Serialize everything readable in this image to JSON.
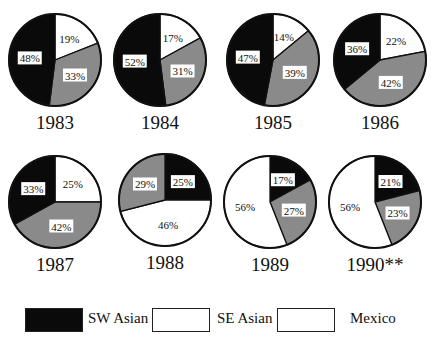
{
  "chart_data": [
    {
      "type": "pie",
      "title": "1983",
      "slices": [
        {
          "name": "SE Asian",
          "value": 19,
          "label": "19%"
        },
        {
          "name": "Mexico",
          "value": 33,
          "label": "33%"
        },
        {
          "name": "SW Asian",
          "value": 48,
          "label": "48%"
        }
      ]
    },
    {
      "type": "pie",
      "title": "1984",
      "slices": [
        {
          "name": "SE Asian",
          "value": 17,
          "label": "17%"
        },
        {
          "name": "Mexico",
          "value": 31,
          "label": "31%"
        },
        {
          "name": "SW Asian",
          "value": 52,
          "label": "52%"
        }
      ]
    },
    {
      "type": "pie",
      "title": "1985",
      "slices": [
        {
          "name": "SE Asian",
          "value": 14,
          "label": "14%"
        },
        {
          "name": "Mexico",
          "value": 39,
          "label": "39%"
        },
        {
          "name": "SW Asian",
          "value": 47,
          "label": "47%"
        }
      ]
    },
    {
      "type": "pie",
      "title": "1986",
      "slices": [
        {
          "name": "SE Asian",
          "value": 22,
          "label": "22%"
        },
        {
          "name": "Mexico",
          "value": 42,
          "label": "42%"
        },
        {
          "name": "SW Asian",
          "value": 36,
          "label": "36%"
        }
      ]
    },
    {
      "type": "pie",
      "title": "1987",
      "slices": [
        {
          "name": "SE Asian",
          "value": 25,
          "label": "25%"
        },
        {
          "name": "Mexico",
          "value": 42,
          "label": "42%"
        },
        {
          "name": "SW Asian",
          "value": 33,
          "label": "33%"
        }
      ]
    },
    {
      "type": "pie",
      "title": "1988",
      "slices": [
        {
          "name": "SW Asian",
          "value": 25,
          "label": "25%"
        },
        {
          "name": "SE Asian",
          "value": 46,
          "label": "46%"
        },
        {
          "name": "Mexico",
          "value": 29,
          "label": "29%"
        }
      ]
    },
    {
      "type": "pie",
      "title": "1989",
      "slices": [
        {
          "name": "SW Asian",
          "value": 17,
          "label": "17%"
        },
        {
          "name": "Mexico",
          "value": 27,
          "label": "27%"
        },
        {
          "name": "SE Asian",
          "value": 56,
          "label": "56%"
        }
      ]
    },
    {
      "type": "pie",
      "title": "1990**",
      "slices": [
        {
          "name": "SW Asian",
          "value": 21,
          "label": "21%"
        },
        {
          "name": "Mexico",
          "value": 23,
          "label": "23%"
        },
        {
          "name": "SE Asian",
          "value": 56,
          "label": "56%"
        }
      ]
    }
  ],
  "colors": {
    "SW Asian": "#0a0a0a",
    "SE Asian": "#ffffff",
    "Mexico": "#8a8a8a"
  },
  "layout": [
    {
      "cx": 55,
      "cy": 60,
      "r": 46
    },
    {
      "cx": 160,
      "cy": 60,
      "r": 46
    },
    {
      "cx": 273,
      "cy": 60,
      "r": 46
    },
    {
      "cx": 380,
      "cy": 60,
      "r": 46
    },
    {
      "cx": 55,
      "cy": 202,
      "r": 46
    },
    {
      "cx": 165,
      "cy": 200,
      "r": 46
    },
    {
      "cx": 270,
      "cy": 202,
      "r": 46
    },
    {
      "cx": 375,
      "cy": 202,
      "r": 46
    }
  ],
  "legend": {
    "items": [
      {
        "label": "SW Asian",
        "swatch": "#0a0a0a",
        "x": 0,
        "label_x": 63
      },
      {
        "label": "SE Asian",
        "swatch": "#ffffff",
        "x": 127,
        "label_x": 192
      },
      {
        "label": "Mexico",
        "swatch": "#ffffff",
        "x": 252,
        "label_x": 325
      }
    ]
  }
}
